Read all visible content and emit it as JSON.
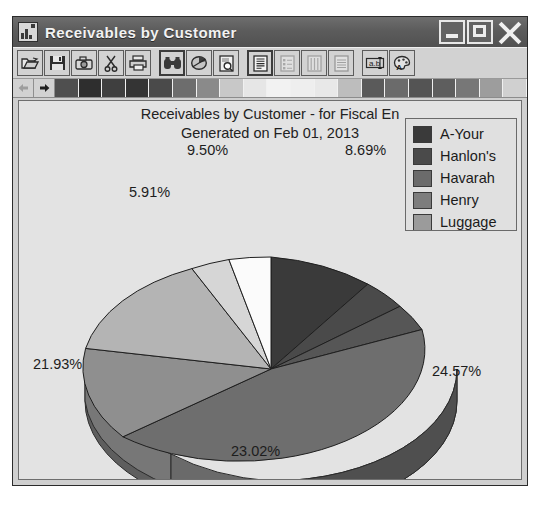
{
  "window": {
    "title": "Receivables by Customer",
    "icon": "chart-report-icon",
    "buttons": {
      "minimize": "Minimize",
      "maximize": "Maximize",
      "close": "Close"
    }
  },
  "toolbar": {
    "items": [
      {
        "name": "open-icon",
        "label": "Open",
        "state": "normal"
      },
      {
        "name": "save-icon",
        "label": "Save",
        "state": "normal"
      },
      {
        "name": "camera-icon",
        "label": "Snapshot",
        "state": "normal"
      },
      {
        "name": "scissors-icon",
        "label": "Cut",
        "state": "normal"
      },
      {
        "name": "printer-icon",
        "label": "Print",
        "state": "normal"
      },
      {
        "name": "binoculars-icon",
        "label": "Find",
        "state": "pressed"
      },
      {
        "name": "pie-chart-icon",
        "label": "Pie Chart",
        "state": "normal"
      },
      {
        "name": "print-preview-icon",
        "label": "Print Preview",
        "state": "normal"
      },
      {
        "name": "report-icon",
        "label": "Report",
        "state": "pressed"
      },
      {
        "name": "list-report-icon",
        "label": "List Report",
        "state": "disabled"
      },
      {
        "name": "column-report-icon",
        "label": "Column Report",
        "state": "disabled"
      },
      {
        "name": "rows-report-icon",
        "label": "Row Report",
        "state": "disabled"
      },
      {
        "name": "text-box-icon",
        "label": "Text Box",
        "state": "normal"
      },
      {
        "name": "paint-palette-icon",
        "label": "Colors",
        "state": "normal"
      }
    ]
  },
  "palette": {
    "prev_icon": "arrow-left-icon",
    "next_icon": "arrow-right-icon",
    "swatches": [
      "#4f4f4f",
      "#2e2e2e",
      "#3f3f3f",
      "#343434",
      "#4a4a4a",
      "#6d6d6d",
      "#8a8a8a",
      "#c8c8c8",
      "#e6e6e6",
      "#f2f2f2",
      "#eeeeee",
      "#e8e8e8",
      "#bdbdbd",
      "#5a5a5a",
      "#6b6b6b",
      "#545454",
      "#5e5e5e",
      "#777777",
      "#9d9d9d",
      "#d0d0d0"
    ]
  },
  "chart_data": {
    "type": "pie",
    "title": "Receivables by Customer - for Fiscal En",
    "subtitle": "Generated on Feb 01, 2013",
    "legend_position": "top-right",
    "three_d": true,
    "grid": false,
    "xlabel": "",
    "ylabel": "",
    "categories": [
      "A-Your",
      "Hanlon's",
      "Havarah",
      "Henry",
      "Luggage",
      "Slice 6",
      "Slice 7",
      "Slice 8"
    ],
    "values": [
      8.69,
      3.5,
      2.88,
      24.57,
      23.02,
      21.93,
      5.91,
      9.5
    ],
    "labels": [
      "8.69%",
      "",
      "",
      "24.57%",
      "23.02%",
      "21.93%",
      "5.91%",
      "9.50%"
    ],
    "colors": [
      "#3a3a3a",
      "#4a4a4a",
      "#565656",
      "#6e6e6e",
      "#8f8f8f",
      "#b4b4b4",
      "#d6d6d6",
      "#fbfbfb"
    ],
    "visible_labels": [
      "9.50%",
      "8.69%",
      "5.91%",
      "21.93%",
      "24.57%",
      "23.02%"
    ]
  },
  "legend": {
    "entries": [
      {
        "label": "A-Your",
        "color": "#3a3a3a"
      },
      {
        "label": "Hanlon's",
        "color": "#4a4a4a"
      },
      {
        "label": "Havarah",
        "color": "#6b6b6b"
      },
      {
        "label": "Henry",
        "color": "#7d7d7d"
      },
      {
        "label": "Luggage",
        "color": "#9b9b9b"
      }
    ]
  }
}
